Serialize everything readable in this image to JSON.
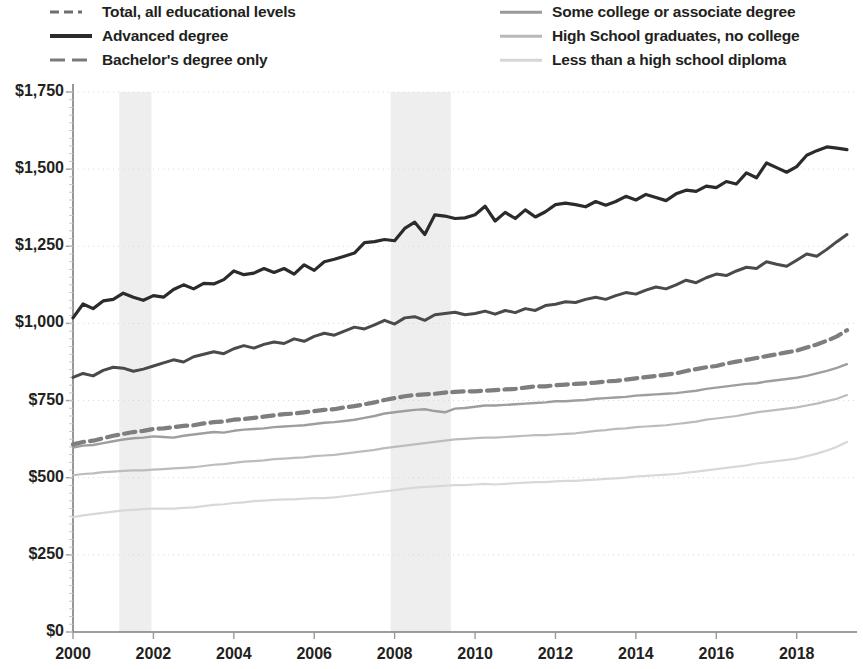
{
  "legend": {
    "left_items": [
      {
        "label": "Total, all educational levels",
        "style": "dashdot",
        "color": "#6e6e6e",
        "width": 3
      },
      {
        "label": "Advanced degree",
        "style": "solid",
        "color": "#2b2b2b",
        "width": 4
      },
      {
        "label": "Bachelor's degree only",
        "style": "dashed",
        "color": "#7a7a7a",
        "width": 3
      }
    ],
    "right_items": [
      {
        "label": "Some college or associate degree",
        "style": "solid",
        "color": "#9a9a9a",
        "width": 2.5
      },
      {
        "label": "High School graduates, no college",
        "style": "solid",
        "color": "#b9b9b9",
        "width": 2.5
      },
      {
        "label": "Less than a high school diploma",
        "style": "solid",
        "color": "#d6d6d6",
        "width": 2.5
      }
    ]
  },
  "chart_data": {
    "type": "line",
    "title": "",
    "subtitle": "",
    "xlabel": "",
    "ylabel": "",
    "xlim": [
      2000.0,
      2019.5
    ],
    "ylim": [
      0,
      1750
    ],
    "grid": true,
    "legend_position": "top",
    "y_ticks": [
      0,
      250,
      500,
      750,
      1000,
      1250,
      1500,
      1750
    ],
    "y_tick_labels": [
      "$0",
      "$250",
      "$500",
      "$750",
      "$1,000",
      "$1,250",
      "$1,500",
      "$1,750"
    ],
    "x_ticks": [
      2000,
      2002,
      2004,
      2006,
      2008,
      2010,
      2012,
      2014,
      2016,
      2018
    ],
    "x_tick_labels": [
      "2000",
      "2002",
      "2004",
      "2006",
      "2008",
      "2010",
      "2012",
      "2014",
      "2016",
      "2018"
    ],
    "shaded_regions": [
      {
        "label": "recession",
        "x0": 2001.15,
        "x1": 2001.95,
        "color": "#eeeeee"
      },
      {
        "label": "recession",
        "x0": 2007.9,
        "x1": 2009.4,
        "color": "#eeeeee"
      }
    ],
    "x": [
      2000.0,
      2000.25,
      2000.5,
      2000.75,
      2001.0,
      2001.25,
      2001.5,
      2001.75,
      2002.0,
      2002.25,
      2002.5,
      2002.75,
      2003.0,
      2003.25,
      2003.5,
      2003.75,
      2004.0,
      2004.25,
      2004.5,
      2004.75,
      2005.0,
      2005.25,
      2005.5,
      2005.75,
      2006.0,
      2006.25,
      2006.5,
      2006.75,
      2007.0,
      2007.25,
      2007.5,
      2007.75,
      2008.0,
      2008.25,
      2008.5,
      2008.75,
      2009.0,
      2009.25,
      2009.5,
      2009.75,
      2010.0,
      2010.25,
      2010.5,
      2010.75,
      2011.0,
      2011.25,
      2011.5,
      2011.75,
      2012.0,
      2012.25,
      2012.5,
      2012.75,
      2013.0,
      2013.25,
      2013.5,
      2013.75,
      2014.0,
      2014.25,
      2014.5,
      2014.75,
      2015.0,
      2015.25,
      2015.5,
      2015.75,
      2016.0,
      2016.25,
      2016.5,
      2016.75,
      2017.0,
      2017.25,
      2017.5,
      2017.75,
      2018.0,
      2018.25,
      2018.5,
      2018.75,
      2019.0,
      2019.25
    ],
    "series": [
      {
        "name": "Advanced degree",
        "style": "solid",
        "color": "#2b2b2b",
        "width": 3.2,
        "values": [
          1018,
          1063,
          1048,
          1073,
          1078,
          1098,
          1085,
          1075,
          1090,
          1085,
          1110,
          1125,
          1112,
          1130,
          1128,
          1142,
          1170,
          1158,
          1163,
          1178,
          1165,
          1178,
          1160,
          1190,
          1172,
          1200,
          1208,
          1218,
          1228,
          1262,
          1265,
          1272,
          1268,
          1308,
          1328,
          1288,
          1352,
          1348,
          1340,
          1342,
          1352,
          1380,
          1332,
          1360,
          1340,
          1368,
          1345,
          1362,
          1385,
          1390,
          1385,
          1378,
          1395,
          1383,
          1395,
          1412,
          1400,
          1418,
          1408,
          1398,
          1420,
          1432,
          1428,
          1445,
          1440,
          1460,
          1452,
          1488,
          1472,
          1520,
          1505,
          1490,
          1508,
          1545,
          1560,
          1572,
          1568,
          1563
        ]
      },
      {
        "name": "Bachelor's degree only",
        "style": "solid",
        "color": "#4a4a4a",
        "width": 3.0,
        "values": [
          825,
          838,
          830,
          848,
          858,
          855,
          845,
          852,
          862,
          872,
          882,
          875,
          892,
          900,
          908,
          902,
          918,
          928,
          920,
          932,
          940,
          935,
          950,
          942,
          958,
          968,
          962,
          975,
          988,
          982,
          995,
          1010,
          998,
          1018,
          1022,
          1010,
          1028,
          1032,
          1036,
          1028,
          1032,
          1040,
          1030,
          1042,
          1035,
          1048,
          1042,
          1058,
          1062,
          1070,
          1068,
          1078,
          1085,
          1078,
          1090,
          1100,
          1095,
          1108,
          1118,
          1112,
          1125,
          1140,
          1132,
          1148,
          1160,
          1155,
          1170,
          1182,
          1178,
          1200,
          1192,
          1185,
          1205,
          1225,
          1218,
          1240,
          1265,
          1288
        ]
      },
      {
        "name": "Total, all educational levels",
        "style": "dashed",
        "color": "#7e7e7e",
        "width": 4.2,
        "values": [
          608,
          616,
          620,
          628,
          636,
          642,
          648,
          652,
          658,
          660,
          664,
          668,
          670,
          676,
          680,
          682,
          688,
          690,
          694,
          698,
          702,
          706,
          708,
          712,
          716,
          720,
          722,
          728,
          732,
          738,
          744,
          752,
          758,
          764,
          768,
          770,
          772,
          776,
          778,
          780,
          780,
          782,
          784,
          786,
          788,
          792,
          796,
          796,
          800,
          802,
          804,
          806,
          808,
          812,
          814,
          818,
          822,
          826,
          830,
          834,
          838,
          846,
          852,
          858,
          862,
          870,
          876,
          882,
          888,
          894,
          900,
          906,
          912,
          922,
          932,
          944,
          958,
          978
        ]
      },
      {
        "name": "Some college or associate degree",
        "style": "solid",
        "color": "#9e9e9e",
        "width": 2.4,
        "values": [
          598,
          604,
          606,
          612,
          618,
          624,
          628,
          630,
          634,
          632,
          630,
          636,
          640,
          644,
          648,
          646,
          652,
          656,
          658,
          660,
          664,
          666,
          668,
          670,
          674,
          678,
          680,
          684,
          688,
          694,
          700,
          708,
          712,
          716,
          720,
          722,
          716,
          712,
          724,
          726,
          730,
          734,
          734,
          736,
          738,
          740,
          742,
          744,
          748,
          748,
          750,
          752,
          756,
          758,
          760,
          762,
          766,
          768,
          770,
          772,
          774,
          778,
          782,
          788,
          792,
          796,
          800,
          804,
          806,
          812,
          816,
          820,
          824,
          830,
          838,
          846,
          856,
          868
        ]
      },
      {
        "name": "High School graduates, no college",
        "style": "solid",
        "color": "#bcbcbc",
        "width": 2.2,
        "values": [
          508,
          512,
          514,
          518,
          520,
          522,
          524,
          524,
          526,
          528,
          530,
          532,
          534,
          538,
          542,
          544,
          548,
          552,
          554,
          556,
          560,
          562,
          564,
          566,
          570,
          572,
          574,
          578,
          582,
          586,
          590,
          596,
          600,
          604,
          608,
          612,
          616,
          620,
          624,
          626,
          628,
          630,
          630,
          632,
          634,
          636,
          638,
          638,
          640,
          642,
          644,
          648,
          652,
          654,
          658,
          660,
          664,
          666,
          668,
          670,
          674,
          678,
          682,
          688,
          692,
          696,
          700,
          706,
          712,
          716,
          720,
          724,
          728,
          734,
          740,
          748,
          756,
          768
        ]
      },
      {
        "name": "Less than a high school diploma",
        "style": "solid",
        "color": "#d8d8d8",
        "width": 2.2,
        "values": [
          372,
          378,
          382,
          386,
          390,
          394,
          396,
          398,
          400,
          400,
          400,
          402,
          404,
          408,
          412,
          414,
          418,
          420,
          424,
          426,
          428,
          430,
          430,
          432,
          434,
          434,
          436,
          440,
          444,
          448,
          452,
          456,
          460,
          464,
          468,
          470,
          472,
          474,
          476,
          476,
          478,
          480,
          478,
          480,
          482,
          484,
          486,
          486,
          488,
          490,
          490,
          492,
          494,
          496,
          498,
          500,
          504,
          506,
          508,
          510,
          512,
          516,
          520,
          524,
          528,
          532,
          536,
          540,
          546,
          550,
          554,
          558,
          562,
          570,
          578,
          588,
          600,
          616
        ]
      }
    ]
  }
}
